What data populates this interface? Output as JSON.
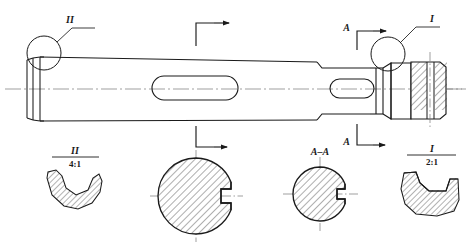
{
  "drawing": {
    "type": "mechanical-engineering-part-drawing",
    "subject": "stepped-shaft-with-keyways",
    "background_color": "#ffffff",
    "line_color": "#1a1a1a",
    "centerline_color": "#666666",
    "hatch_color": "#333333"
  },
  "main_view": {
    "name": "shaft-elevation",
    "detail_callouts": [
      {
        "id": "detail-callout-2",
        "label": "II",
        "position": "left-end-top"
      },
      {
        "id": "detail-callout-1",
        "label": "I",
        "position": "right-end-top"
      }
    ],
    "section_markers": [
      {
        "id": "section-marker-unlabeled-top",
        "label": "",
        "arrow": "right",
        "position": "top-middle"
      },
      {
        "id": "section-marker-unlabeled-bottom",
        "label": "",
        "arrow": "right",
        "position": "bottom-middle"
      },
      {
        "id": "section-marker-a-top",
        "label": "A",
        "arrow": "right",
        "position": "top-right"
      },
      {
        "id": "section-marker-a-bottom",
        "label": "A",
        "arrow": "right",
        "position": "bottom-right"
      }
    ],
    "features": [
      {
        "name": "left-end-collar"
      },
      {
        "name": "main-tapered-body"
      },
      {
        "name": "large-keyway-slot"
      },
      {
        "name": "step-shoulder"
      },
      {
        "name": "small-keyway-slot"
      },
      {
        "name": "groove"
      },
      {
        "name": "right-end-sectioned-boss"
      }
    ]
  },
  "detail_views": [
    {
      "id": "detail-view-2",
      "label": "II",
      "scale": "4:1",
      "shape": "curved-groove-profile-hatched"
    },
    {
      "id": "detail-view-1",
      "label": "I",
      "scale": "2:1",
      "shape": "vee-groove-profile-hatched"
    }
  ],
  "section_views": [
    {
      "id": "section-view-unlabeled",
      "label": "",
      "shape": "large-hatched-circle-with-keyway-notch",
      "radius_px": 38
    },
    {
      "id": "section-view-a-a",
      "label": "A–A",
      "shape": "small-hatched-circle-with-keyway-notch",
      "radius_px": 27
    }
  ]
}
